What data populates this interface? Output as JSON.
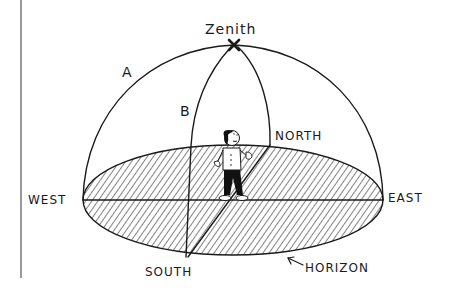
{
  "diagram": {
    "type": "celestial-sphere",
    "labels": {
      "zenith": "Zenith",
      "zenith_mark": "X",
      "arc_a": "A",
      "arc_b": "B",
      "north": "NORTH",
      "south": "SOUTH",
      "east": "EAST",
      "west": "WEST",
      "horizon": "HORIZON"
    },
    "colors": {
      "ink": "#1a1a1a",
      "background": "#ffffff",
      "margin_line": "#555555"
    }
  }
}
